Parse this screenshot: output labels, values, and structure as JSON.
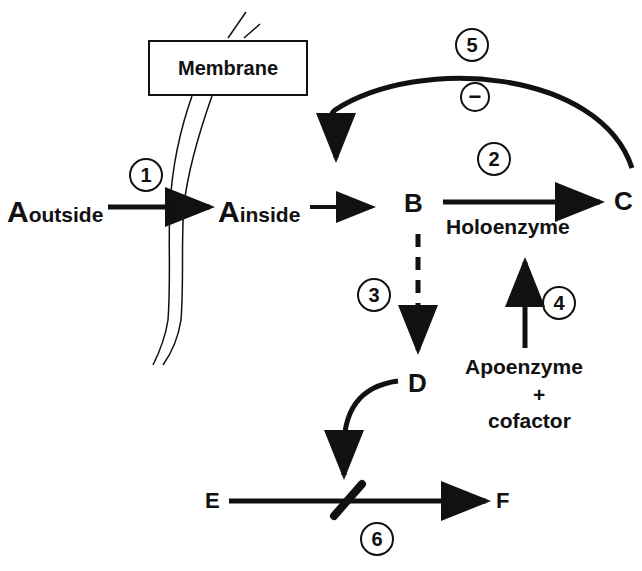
{
  "membrane": {
    "label": "Membrane"
  },
  "nodes": {
    "a_outside": {
      "main": "A",
      "sub": "outside"
    },
    "a_inside": {
      "main": "A",
      "sub": "inside"
    },
    "b": "B",
    "c": "C",
    "d": "D",
    "e": "E",
    "f": "F"
  },
  "labels": {
    "holoenzyme": "Holoenzyme",
    "apoenzyme": "Apoenzyme",
    "plus": "+",
    "cofactor": "cofactor",
    "inhibition": "−"
  },
  "steps": [
    "1",
    "2",
    "3",
    "4",
    "5",
    "6"
  ],
  "colors": {
    "ink": "#111111",
    "background": "#ffffff"
  }
}
